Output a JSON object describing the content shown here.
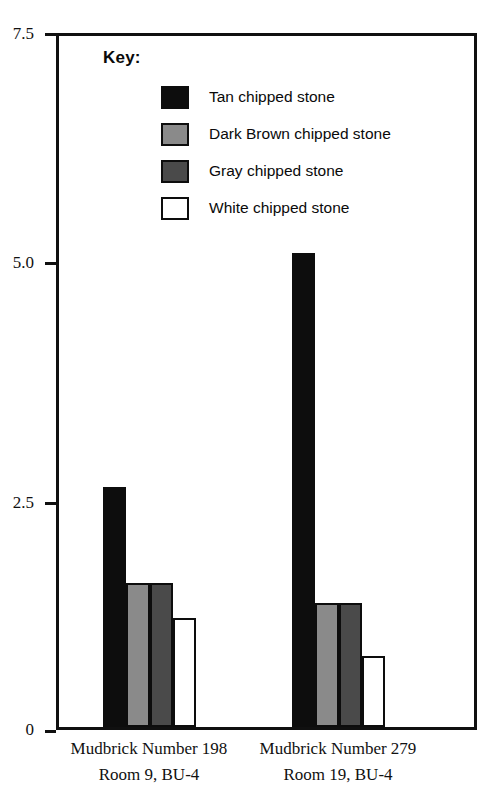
{
  "chart_data": {
    "type": "bar",
    "title": "",
    "xlabel": "",
    "ylabel": "",
    "ylim": [
      0,
      7.5
    ],
    "yticks": [
      "0",
      "2.5",
      "5.0",
      "7.5"
    ],
    "ytick_values": [
      0,
      2.5,
      5.0,
      7.5
    ],
    "grid": false,
    "legend_position": "inside-top-left",
    "legend_title": "Key:",
    "categories": [
      "Mudbrick Number 198",
      "Mudbrick Number 279"
    ],
    "category_sublabels": [
      "Room 9, BU-4",
      "Room 19, BU-4"
    ],
    "series": [
      {
        "name": "Tan chipped stone",
        "color": "#0d0d0d",
        "values": [
          2.6,
          5.15
        ]
      },
      {
        "name": "Dark Brown chipped stone",
        "color": "#8a8a8a",
        "values": [
          1.56,
          1.35
        ]
      },
      {
        "name": "Gray chipped stone",
        "color": "#4a4a4a",
        "values": [
          1.56,
          1.35
        ]
      },
      {
        "name": "White chipped stone",
        "color": "#ffffff",
        "values": [
          1.18,
          0.77
        ]
      }
    ]
  },
  "axis": {
    "tick_0": "0",
    "tick_1": "2.5",
    "tick_2": "5.0",
    "tick_3": "7.5"
  },
  "legend": {
    "title": "Key:",
    "items": [
      {
        "label": "Tan chipped stone"
      },
      {
        "label": "Dark Brown chipped stone"
      },
      {
        "label": "Gray chipped stone"
      },
      {
        "label": "White chipped stone"
      }
    ]
  },
  "xaxis": {
    "groups": [
      {
        "line1": "Mudbrick Number 198",
        "line2": "Room 9, BU-4"
      },
      {
        "line1": "Mudbrick Number 279",
        "line2": "Room 19, BU-4"
      }
    ]
  },
  "colors": {
    "tan": "#0d0d0d",
    "dark_brown": "#8a8a8a",
    "gray": "#4a4a4a",
    "white": "#ffffff",
    "axis": "#101010"
  }
}
